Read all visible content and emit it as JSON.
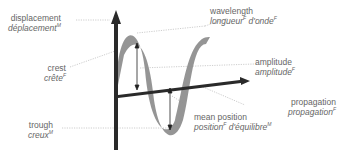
{
  "diagram": {
    "title": "wave",
    "labels": {
      "displacement": {
        "en": "displacement",
        "fr": "déplacement",
        "gender": "M"
      },
      "wavelength": {
        "en": "wavelength",
        "fr": "longueur",
        "gender": "F",
        "fr2": "d'onde",
        "gender2": "F"
      },
      "crest": {
        "en": "crest",
        "fr": "crête",
        "gender": "F"
      },
      "amplitude": {
        "en": "amplitude",
        "fr": "amplitude",
        "gender": "F"
      },
      "propagation": {
        "en": "propagation",
        "fr": "propagation",
        "gender": "F"
      },
      "trough": {
        "en": "trough",
        "fr": "creux",
        "gender": "M"
      },
      "mean_position": {
        "en": "mean position",
        "fr": "position",
        "gender": "F",
        "fr2": "d'équilibre",
        "gender2": "M"
      }
    },
    "colors": {
      "axis": "#2a2a2a",
      "wave": "#8a8a8a",
      "leader": "#b0b0b0",
      "text": "#666666"
    }
  }
}
